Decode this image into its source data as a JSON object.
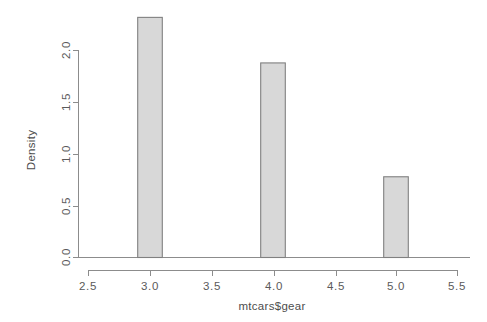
{
  "chart_data": {
    "type": "bar",
    "title": "",
    "subtitle": "",
    "xlabel": "mtcars$gear",
    "ylabel": "Density",
    "grid": false,
    "legend": "none",
    "xlim": [
      2.5,
      5.5
    ],
    "ylim": [
      0.0,
      2.4
    ],
    "xticks": [
      "2.5",
      "3.0",
      "3.5",
      "4.0",
      "4.5",
      "5.0",
      "5.5"
    ],
    "xtick_values": [
      2.5,
      3.0,
      3.5,
      4.0,
      4.5,
      5.0,
      5.5
    ],
    "yticks": [
      "0.0",
      "0.5",
      "1.0",
      "1.5",
      "2.0"
    ],
    "ytick_values": [
      0.0,
      0.5,
      1.0,
      1.5,
      2.0
    ],
    "categories": [
      "3.0",
      "4.0",
      "5.0"
    ],
    "values": [
      2.32,
      1.88,
      0.78
    ],
    "bins": [
      {
        "label": "3.0",
        "left": 2.9,
        "right": 3.1,
        "density": 2.32
      },
      {
        "label": "4.0",
        "left": 3.9,
        "right": 4.1,
        "density": 1.88
      },
      {
        "label": "5.0",
        "left": 4.9,
        "right": 5.1,
        "density": 0.78
      }
    ],
    "bar_fill": "#d8d8d8",
    "bar_stroke": "#808080",
    "axis_color": "#8c8c8c",
    "background": "#ffffff"
  },
  "axes": {
    "y_title": "Density",
    "x_title": "mtcars$gear",
    "x_tick_labels": [
      "2.5",
      "3.0",
      "3.5",
      "4.0",
      "4.5",
      "5.0",
      "5.5"
    ],
    "y_tick_labels": [
      "0.0",
      "0.5",
      "1.0",
      "1.5",
      "2.0"
    ]
  }
}
